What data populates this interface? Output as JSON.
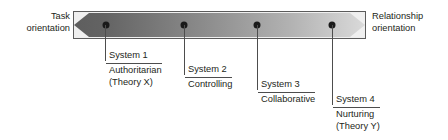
{
  "diagram": {
    "type": "spectrum",
    "left_end": {
      "line1": "Task",
      "line2": "orientation"
    },
    "right_end": {
      "line1": "Relationship",
      "line2": "orientation"
    },
    "bar": {
      "gradient_from": "#595959",
      "gradient_to": "#d9d9d9",
      "border_color": "#5b5b5b",
      "background_color": "#efefef"
    },
    "markers": [
      {
        "name": "System 1",
        "description": "Authoritarian",
        "theory": "(Theory X)",
        "position_pct": 11
      },
      {
        "name": "System 2",
        "description": "Controlling",
        "theory": "",
        "position_pct": 38
      },
      {
        "name": "System 3",
        "description": "Collaborative",
        "theory": "",
        "position_pct": 63
      },
      {
        "name": "System 4",
        "description": "Nurturing",
        "theory": "(Theory Y)",
        "position_pct": 89
      }
    ]
  }
}
